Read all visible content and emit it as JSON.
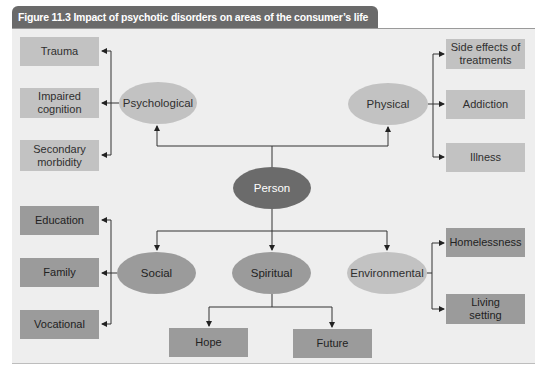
{
  "figure": {
    "title": "Figure 11.3  Impact of psychotic disorders on areas of the consumer’s life"
  },
  "center": {
    "label": "Person"
  },
  "domains": {
    "psychological": {
      "label": "Psychological",
      "items": [
        "Trauma",
        "Impaired cognition",
        "Secondary morbidity"
      ]
    },
    "physical": {
      "label": "Physical",
      "items": [
        "Side effects of treatments",
        "Addiction",
        "Illness"
      ]
    },
    "social": {
      "label": "Social",
      "items": [
        "Education",
        "Family",
        "Vocational"
      ]
    },
    "spiritual": {
      "label": "Spiritual",
      "items": [
        "Hope",
        "Future"
      ]
    },
    "environmental": {
      "label": "Environmental",
      "items": [
        "Homelessness",
        "Living setting"
      ]
    }
  },
  "colors": {
    "title_bar": "#6a6a6a",
    "panel_bg": "#eeeeee",
    "light_node": "#c2c2c2",
    "dark_node": "#9b9b9b",
    "person_node": "#6b6b6b",
    "line": "#222222"
  }
}
